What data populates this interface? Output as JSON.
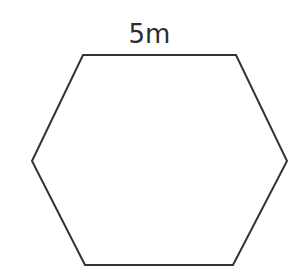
{
  "figure": {
    "type": "geometry-diagram",
    "shape_name": "hexagon",
    "background_color": "#ffffff",
    "stroke_color": "#333333",
    "stroke_width": 2,
    "fill_color": "none",
    "label": {
      "text": "5m",
      "value": 5,
      "unit": "m",
      "measures": "top-side-length",
      "color": "#2e2e2e",
      "font_size": 26
    },
    "vertices": [
      {
        "name": "top-left",
        "x": 83,
        "y": 55
      },
      {
        "name": "top-right",
        "x": 236,
        "y": 55
      },
      {
        "name": "middle-right",
        "x": 287,
        "y": 161
      },
      {
        "name": "bottom-right",
        "x": 233,
        "y": 265
      },
      {
        "name": "bottom-left",
        "x": 85,
        "y": 265
      },
      {
        "name": "middle-left",
        "x": 32,
        "y": 161
      }
    ],
    "points_attr": "83,55 236,55 287,161 233,265 85,265 32,161"
  }
}
